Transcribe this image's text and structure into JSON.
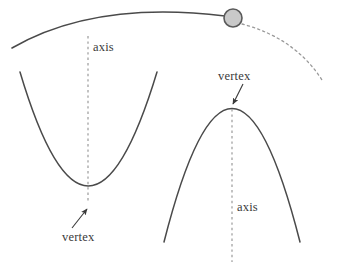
{
  "figure": {
    "background_color": "#ffffff",
    "stroke_color": "#4a4a4a",
    "dash_color": "#9a9a9a",
    "text_color": "#3a3a3a",
    "ball": {
      "name": "projectile-ball",
      "fill_color": "#c9c9c9",
      "stroke_color": "#5a5a5a",
      "center_x": 233,
      "center_y": 18,
      "radius": 9
    },
    "labels": {
      "axis_left": "axis",
      "vertex_left": "vertex",
      "vertex_right": "vertex",
      "axis_right": "axis"
    },
    "curves": {
      "trajectory_solid": {
        "name": "projectile-trajectory-solid",
        "style": "solid",
        "path": "M 12 48 Q 95 0 225 16"
      },
      "trajectory_dashed": {
        "name": "projectile-trajectory-dashed",
        "style": "dashed",
        "path": "M 242 24 Q 295 38 322 80"
      },
      "parabola_up": {
        "name": "upward-parabola",
        "style": "solid",
        "direction": "opens-up",
        "vertex_x": 88,
        "vertex_y": 204,
        "path": "M 20 72 Q 88 300 157 72"
      },
      "parabola_down": {
        "name": "downward-parabola",
        "style": "solid",
        "direction": "opens-down",
        "vertex_x": 232,
        "vertex_y": 108,
        "path": "M 164 242 Q 232 -25 300 242"
      },
      "axis_line_left": {
        "name": "axis-of-symmetry-left",
        "style": "dashed",
        "x": 88,
        "y_start": 36,
        "y_end": 203
      },
      "axis_line_right": {
        "name": "axis-of-symmetry-right",
        "style": "dashed",
        "x": 232,
        "y_start": 109,
        "y_end": 262
      }
    },
    "arrows": {
      "vertex_left_arrow": {
        "name": "vertex-left-pointer",
        "from_x": 72,
        "from_y": 228,
        "to_x": 87,
        "to_y": 208
      },
      "vertex_right_arrow": {
        "name": "vertex-right-pointer",
        "from_x": 242,
        "from_y": 85,
        "to_x": 232,
        "to_y": 105
      }
    }
  }
}
